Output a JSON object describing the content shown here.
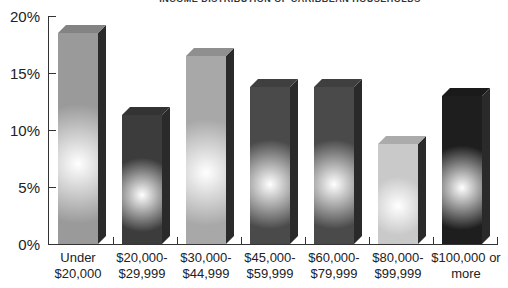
{
  "chart_data": {
    "type": "bar",
    "title": "INCOME DISTRIBUTION OF CARIBBEAN HOUSEHOLDS",
    "xlabel": "",
    "ylabel": "",
    "ylim": [
      0,
      20
    ],
    "yticks": [
      "0%",
      "5%",
      "10%",
      "15%",
      "20%"
    ],
    "categories": [
      "Under $20,000",
      "$20,000-$29,999",
      "$30,000-$44,999",
      "$45,000-$59,999",
      "$60,000-$79,999",
      "$80,000-$99,999",
      "$100,000 or more"
    ],
    "values": [
      18.5,
      11.3,
      16.5,
      13.8,
      13.8,
      8.8,
      13.0
    ],
    "grid": false,
    "legend": "none",
    "style": "3d-bars"
  },
  "labels": {
    "title": "INCOME DISTRIBUTION OF CARIBBEAN HOUSEHOLDS",
    "yticks": [
      "20%",
      "15%",
      "10%",
      "5%",
      "0%"
    ],
    "x": [
      {
        "l1": "Under",
        "l2": "$20,000"
      },
      {
        "l1": "$20,000-",
        "l2": "$29,999"
      },
      {
        "l1": "$30,000-",
        "l2": "$44,999"
      },
      {
        "l1": "$45,000-",
        "l2": "$59,999"
      },
      {
        "l1": "$60,000-",
        "l2": "$79,999"
      },
      {
        "l1": "$80,000-",
        "l2": "$99,999"
      },
      {
        "l1": "$100,000 or",
        "l2": "more"
      }
    ]
  },
  "colors": {
    "bars": [
      "#9a9a9a",
      "#3c3c3c",
      "#a8a8a8",
      "#4a4a4a",
      "#4a4a4a",
      "#c9c9c9",
      "#1e1e1e"
    ]
  }
}
